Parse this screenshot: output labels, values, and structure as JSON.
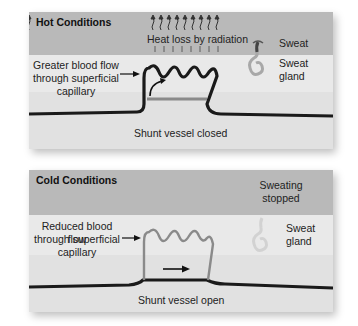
{
  "hot": {
    "title": "Hot Conditions",
    "heat_label": "Heat loss by radiation",
    "capillary_label_1": "Greater blood flow",
    "capillary_label_2": "through superficial",
    "capillary_label_3": "capillary",
    "sweat_label": "Sweat",
    "gland_label": "Sweat gland",
    "shunt_label": "Shunt vessel closed"
  },
  "cold": {
    "title": "Cold Conditions",
    "sweating_label_1": "Sweating",
    "sweating_label_2": "stopped",
    "capillary_label_1": "Reduced blood flow",
    "capillary_label_2": "through superficial",
    "capillary_label_3": "capillary",
    "gland_label": "Sweat gland",
    "shunt_label": "Shunt vessel open"
  },
  "colors": {
    "band_top": "#b9b9b9",
    "band_mid": "#e9e9e9",
    "vessel_dark": "#1a1a1a",
    "vessel_gray": "#8a8a8a",
    "gland_gray": "#a8a8a8"
  }
}
